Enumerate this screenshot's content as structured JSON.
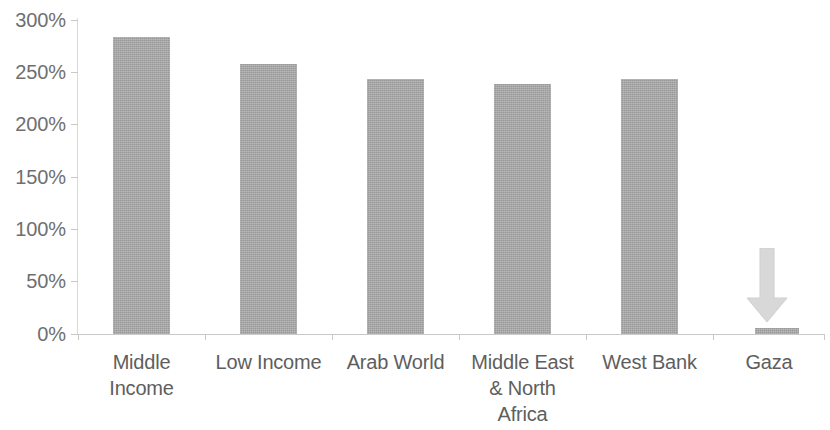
{
  "chart_data": {
    "type": "bar",
    "title": "",
    "subtitle": "",
    "xlabel": "",
    "ylabel": "",
    "categories": [
      "Middle Income",
      "Low Income",
      "Arab World",
      "Middle East & North Africa",
      "West Bank",
      "Gaza"
    ],
    "category_lines": [
      [
        "Middle",
        "Income"
      ],
      [
        "Low Income"
      ],
      [
        "Arab World"
      ],
      [
        "Middle East",
        "& North",
        "Africa"
      ],
      [
        "West Bank"
      ],
      [
        "Gaza"
      ]
    ],
    "values": [
      284,
      258,
      244,
      239,
      244,
      6
    ],
    "value_labels": [
      "284%",
      "258%",
      "244%",
      "239%",
      "244%",
      "6%"
    ],
    "ylim": [
      0,
      300
    ],
    "ytick_values": [
      300,
      250,
      200,
      150,
      100,
      50,
      0
    ],
    "ytick_labels": [
      "300%",
      "250%",
      "200%",
      "150%",
      "100%",
      "50%",
      "0%"
    ],
    "grid": false,
    "legend": null,
    "legend_position": "none",
    "series": [
      {
        "name": "",
        "values": [
          284,
          258,
          244,
          239,
          244,
          6
        ]
      }
    ],
    "annotations": [
      {
        "type": "arrow",
        "direction": "down",
        "target_category": "Gaza",
        "label": ""
      }
    ],
    "colors": {
      "bar": "#a8a8a8",
      "axis": "#c9c9c9",
      "tick_label": "#6f6f6f",
      "category_label": "#5e5e5e",
      "annotation_arrow": "#d6d6d6",
      "background": "#ffffff"
    }
  }
}
